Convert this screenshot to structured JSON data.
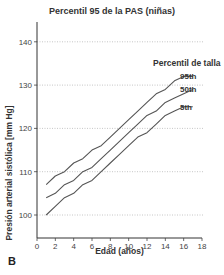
{
  "chart_data": {
    "type": "line",
    "title": "Percentil 95 de la PAS (niñas)",
    "xlabel": "Edad (años)",
    "ylabel": "Presión arterial sistólica [mm Hg]",
    "xlim": [
      0,
      18
    ],
    "ylim": [
      95,
      145
    ],
    "x_ticks": [
      0,
      2,
      4,
      6,
      8,
      10,
      12,
      14,
      16,
      18
    ],
    "y_ticks": [
      100,
      110,
      120,
      130,
      140
    ],
    "grid": "horizontal dotted at y ticks",
    "legend_title": "Percentil de talla",
    "legend_position": "right, inline labels at line ends",
    "x": [
      1,
      2,
      3,
      4,
      5,
      6,
      7,
      8,
      9,
      10,
      11,
      12,
      13,
      14,
      15,
      16,
      17
    ],
    "series": [
      {
        "name": "95th",
        "values": [
          107,
          109,
          110,
          112,
          113,
          115,
          116,
          118,
          120,
          122,
          124,
          126,
          128,
          129,
          131,
          132,
          132
        ]
      },
      {
        "name": "50th",
        "values": [
          104,
          105,
          107,
          108,
          110,
          111,
          113,
          115,
          117,
          119,
          121,
          123,
          124,
          126,
          127,
          128,
          129
        ]
      },
      {
        "name": "5th",
        "values": [
          100,
          102,
          104,
          105,
          107,
          108,
          110,
          112,
          114,
          116,
          118,
          119,
          121,
          123,
          124,
          125,
          125
        ]
      }
    ],
    "panel_label": "B"
  }
}
